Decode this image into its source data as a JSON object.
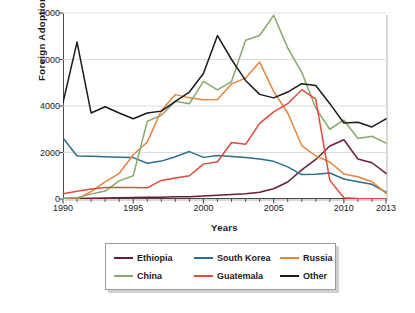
{
  "chart_data": {
    "type": "line",
    "title": "",
    "xlabel": "Years",
    "ylabel": "Foreign  Adoptions",
    "xlim": [
      1990,
      2013
    ],
    "ylim": [
      0,
      8000
    ],
    "grid": true,
    "legend_position": "bottom",
    "y_ticks": [
      0,
      2000,
      4000,
      6000,
      8000
    ],
    "y_tick_labels": [
      "0",
      "2000",
      "4000",
      "6000",
      "8000"
    ],
    "x_ticks": [
      1990,
      1995,
      2000,
      2005,
      2010,
      2013
    ],
    "x_tick_labels": [
      "1990",
      "1995",
      "2000",
      "2005",
      "2010",
      "2013"
    ],
    "x_minor_ticks": [
      1991,
      1992,
      1993,
      1994,
      1996,
      1997,
      1998,
      1999,
      2001,
      2002,
      2003,
      2004,
      2006,
      2007,
      2008,
      2009,
      2011,
      2012
    ],
    "x": [
      1990,
      1991,
      1992,
      1993,
      1994,
      1995,
      1996,
      1997,
      1998,
      1999,
      2000,
      2001,
      2002,
      2003,
      2004,
      2005,
      2006,
      2007,
      2008,
      2009,
      2010,
      2011,
      2012,
      2013
    ],
    "series": [
      {
        "name": "Ethiopia",
        "color": "#6b1f33",
        "values": [
          20,
          25,
          30,
          40,
          50,
          60,
          70,
          80,
          95,
          100,
          130,
          160,
          190,
          230,
          290,
          440,
          730,
          1250,
          1700,
          2280,
          2550,
          1720,
          1560,
          1100
        ]
      },
      {
        "name": "South Korea",
        "color": "#2b6e8f",
        "values": [
          2620,
          1850,
          1840,
          1820,
          1800,
          1780,
          1540,
          1630,
          1820,
          2040,
          1790,
          1870,
          1830,
          1790,
          1720,
          1620,
          1380,
          1050,
          1060,
          1120,
          860,
          740,
          630,
          290
        ]
      },
      {
        "name": "Russia",
        "color": "#e8833a",
        "values": [
          0,
          0,
          320,
          740,
          1100,
          1900,
          2450,
          3800,
          4490,
          4350,
          4270,
          4280,
          4950,
          5200,
          5890,
          4630,
          3700,
          2300,
          1850,
          1590,
          1080,
          960,
          740,
          250
        ]
      },
      {
        "name": "China",
        "color": "#87a96b",
        "values": [
          30,
          60,
          210,
          340,
          780,
          1000,
          3340,
          3600,
          4200,
          4100,
          5060,
          4690,
          5050,
          6830,
          7030,
          7900,
          6500,
          5450,
          3900,
          3000,
          3400,
          2600,
          2700,
          2400
        ]
      },
      {
        "name": "Guatemala",
        "color": "#e14a3c",
        "values": [
          230,
          330,
          430,
          500,
          500,
          490,
          480,
          800,
          900,
          1000,
          1500,
          1600,
          2430,
          2350,
          3250,
          3750,
          4100,
          4700,
          4300,
          800,
          50,
          20,
          10,
          0
        ]
      },
      {
        "name": "Other",
        "color": "#1a1a1a",
        "values": [
          4150,
          6750,
          3700,
          3970,
          3700,
          3450,
          3700,
          3780,
          4200,
          4600,
          5400,
          7030,
          6000,
          5100,
          4500,
          4350,
          4600,
          4960,
          4880,
          4100,
          3270,
          3300,
          3100,
          3450
        ]
      }
    ]
  },
  "legend": {
    "items": [
      {
        "label": "Ethiopia",
        "color": "#6b1f33"
      },
      {
        "label": "South Korea",
        "color": "#2b6e8f"
      },
      {
        "label": "Russia",
        "color": "#e8833a"
      },
      {
        "label": "China",
        "color": "#87a96b"
      },
      {
        "label": "Guatemala",
        "color": "#e14a3c"
      },
      {
        "label": "Other",
        "color": "#1a1a1a"
      }
    ]
  }
}
